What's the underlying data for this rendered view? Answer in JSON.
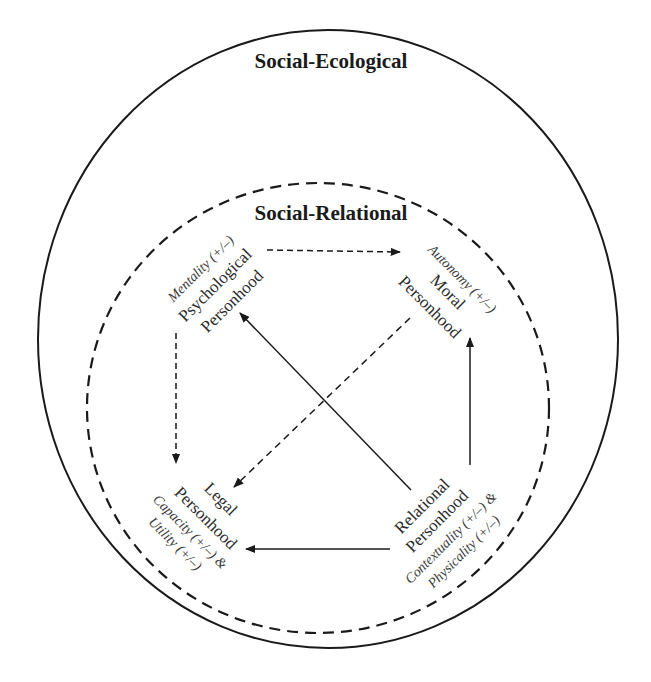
{
  "colors": {
    "background": "#ffffff",
    "stroke": "#1a1a1a",
    "text": "#2a2a2a"
  },
  "outer_boundary": {
    "label": "Social-Ecological",
    "style": "solid"
  },
  "inner_boundary": {
    "label": "Social-Relational",
    "style": "dashed"
  },
  "nodes": {
    "psychological": {
      "attribute": "Mentality (+/–)",
      "line1": "Psychological",
      "line2": "Personhood"
    },
    "moral": {
      "attribute": "Autonomy (+/–)",
      "line1": "Moral",
      "line2": "Personhood"
    },
    "legal": {
      "line1": "Legal",
      "line2": "Personhood",
      "attribute1": "Capacity (+/–) &",
      "attribute2": "Utility (+/–)"
    },
    "relational": {
      "line1": "Relational",
      "line2": "Personhood",
      "attribute1": "Contextuality (+/–) &",
      "attribute2": "Physicality (+/–)"
    }
  },
  "edges": [
    {
      "from": "Psychological Personhood",
      "to": "Moral Personhood",
      "style": "dashed"
    },
    {
      "from": "Psychological Personhood",
      "to": "Legal Personhood",
      "style": "dashed"
    },
    {
      "from": "Moral Personhood",
      "to": "Legal Personhood",
      "style": "dashed"
    },
    {
      "from": "Relational Personhood",
      "to": "Psychological Personhood",
      "style": "solid"
    },
    {
      "from": "Relational Personhood",
      "to": "Moral Personhood",
      "style": "solid"
    },
    {
      "from": "Relational Personhood",
      "to": "Legal Personhood",
      "style": "solid"
    }
  ]
}
